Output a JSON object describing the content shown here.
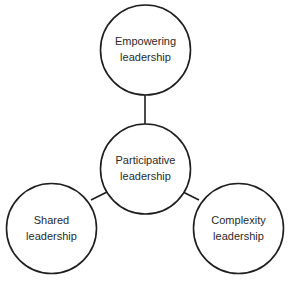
{
  "diagram": {
    "type": "hub-and-spoke",
    "nodes": [
      {
        "id": "empowering",
        "line1": "Empowering",
        "line2": "leadership"
      },
      {
        "id": "participative",
        "line1": "Participative",
        "line2": "leadership"
      },
      {
        "id": "shared",
        "line1": "Shared",
        "line2": "leadership"
      },
      {
        "id": "complexity",
        "line1": "Complexity",
        "line2": "leadership"
      }
    ],
    "edges": [
      {
        "from": "participative",
        "to": "empowering"
      },
      {
        "from": "participative",
        "to": "shared"
      },
      {
        "from": "participative",
        "to": "complexity"
      }
    ],
    "colors": {
      "stroke": "#1e1e1e",
      "fill": "#ffffff",
      "text": "#2a2a2a"
    }
  }
}
